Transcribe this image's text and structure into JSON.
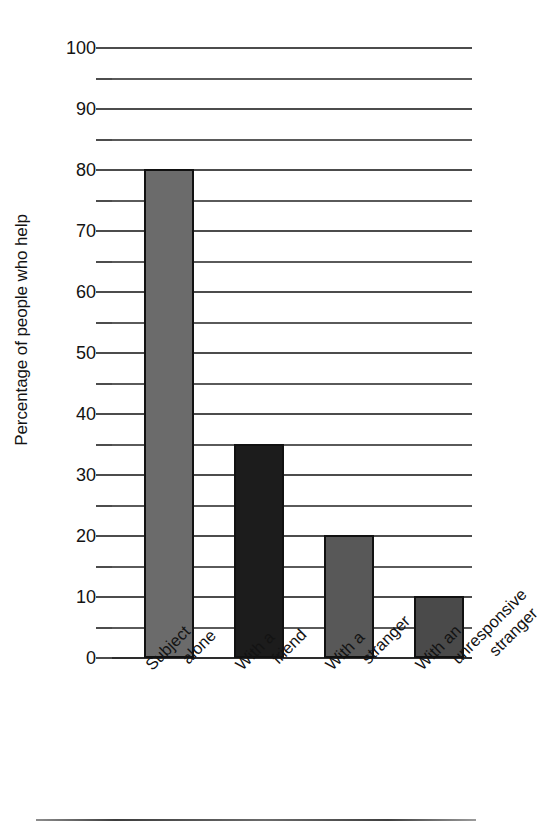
{
  "chart_data": {
    "type": "bar",
    "title": "",
    "xlabel": "",
    "ylabel": "Percentage of people who help",
    "ylim": [
      0,
      100
    ],
    "ytick_step": 10,
    "minor_gridline_step": 5,
    "grid": true,
    "legend": "none",
    "categories": [
      "Subject alone",
      "With a friend",
      "With a stranger",
      "With an unresponsive stranger"
    ],
    "category_lines": [
      [
        "Subject",
        "alone"
      ],
      [
        "With a",
        "friend"
      ],
      [
        "With a",
        "stranger"
      ],
      [
        "With an",
        "unresponsive",
        "stranger"
      ]
    ],
    "values": [
      80,
      35,
      20,
      10
    ],
    "bar_colors": [
      "#6b6b6b",
      "#1c1c1c",
      "#585858",
      "#4a4a4a"
    ],
    "bar_outline_color": "#111111",
    "ytick_labels": [
      "0",
      "10",
      "20",
      "30",
      "40",
      "50",
      "60",
      "70",
      "80",
      "90",
      "100"
    ],
    "ytick_values": [
      0,
      10,
      20,
      30,
      40,
      50,
      60,
      70,
      80,
      90,
      100
    ],
    "minor_tick_values": [
      5,
      15,
      25,
      35,
      45,
      55,
      65,
      75,
      85,
      95
    ],
    "gridline_color": "#4c4c4c",
    "axis_color": "#2d2d2d"
  },
  "figure": {
    "bottom_rule_visible": true
  }
}
